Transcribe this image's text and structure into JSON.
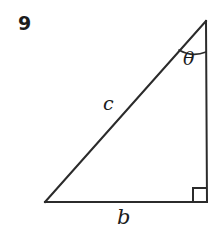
{
  "figure": {
    "kind": "right-triangle-diagram",
    "background_color": "#ffffff",
    "stroke_color": "#2b2b2b",
    "text_color": "#1c1c1c",
    "problem_number": "9",
    "labels": {
      "hypotenuse": "c",
      "base": "b",
      "angle": "θ"
    },
    "markers": {
      "right_angle": "right-angle-square",
      "angle_arc": "angle-arc"
    },
    "geometry": {
      "vertex_bottom_left": [
        45,
        202
      ],
      "vertex_bottom_right": [
        207,
        202
      ],
      "vertex_apex": [
        206,
        21
      ],
      "right_angle_square_size": 14,
      "angle_arc_radius": 30
    }
  }
}
